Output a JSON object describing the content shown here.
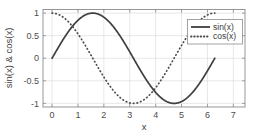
{
  "chart_data": {
    "type": "line",
    "title": "",
    "xlabel": "x",
    "ylabel": "sin(x) & cos(x)",
    "xlim": [
      -0.35,
      7.45
    ],
    "ylim": [
      -1.08,
      1.08
    ],
    "grid": true,
    "legend_position": "top-right",
    "xticks": [
      "0",
      "1",
      "2",
      "3",
      "4",
      "5",
      "6",
      "7"
    ],
    "xtick_values": [
      0,
      1,
      2,
      3,
      4,
      5,
      6,
      7
    ],
    "yticks": [
      "1",
      "0.5",
      "0",
      "-0.5",
      "-1"
    ],
    "ytick_values": [
      1,
      0.5,
      0,
      -0.5,
      -1
    ],
    "x": [
      0,
      0.1571,
      0.3142,
      0.4712,
      0.6283,
      0.7854,
      0.9425,
      1.0996,
      1.2566,
      1.4137,
      1.5708,
      1.7279,
      1.885,
      2.042,
      2.1991,
      2.3562,
      2.5133,
      2.6704,
      2.8274,
      2.9845,
      3.1416,
      3.2987,
      3.4558,
      3.6128,
      3.7699,
      3.927,
      4.0841,
      4.2412,
      4.3982,
      4.5553,
      4.7124,
      4.8695,
      5.0265,
      5.1836,
      5.3407,
      5.4978,
      5.6549,
      5.8119,
      5.969,
      6.1261,
      6.2832
    ],
    "series": [
      {
        "name": "sin(x)",
        "style": "solid",
        "color": "#3f3f3f",
        "values": [
          0,
          0.1564,
          0.309,
          0.454,
          0.5878,
          0.7071,
          0.809,
          0.891,
          0.9511,
          0.9877,
          1,
          0.9877,
          0.9511,
          0.891,
          0.809,
          0.7071,
          0.5878,
          0.454,
          0.309,
          0.1564,
          0,
          -0.1564,
          -0.309,
          -0.454,
          -0.5878,
          -0.7071,
          -0.809,
          -0.891,
          -0.9511,
          -0.9877,
          -1,
          -0.9877,
          -0.9511,
          -0.891,
          -0.809,
          -0.7071,
          -0.5878,
          -0.454,
          -0.309,
          -0.1564,
          0
        ]
      },
      {
        "name": "cos(x)",
        "style": "dotted",
        "color": "#4a4a4a",
        "values": [
          1,
          0.9877,
          0.9511,
          0.891,
          0.809,
          0.7071,
          0.5878,
          0.454,
          0.309,
          0.1564,
          0,
          -0.1564,
          -0.309,
          -0.454,
          -0.5878,
          -0.7071,
          -0.809,
          -0.891,
          -0.9511,
          -0.9877,
          -1,
          -0.9877,
          -0.9511,
          -0.891,
          -0.809,
          -0.7071,
          -0.5878,
          -0.454,
          -0.309,
          -0.1564,
          0,
          0.1564,
          0.309,
          0.454,
          0.5878,
          0.7071,
          0.809,
          0.891,
          0.9511,
          0.9877,
          1
        ]
      }
    ],
    "legend": [
      "sin(x)",
      "cos(x)"
    ]
  }
}
